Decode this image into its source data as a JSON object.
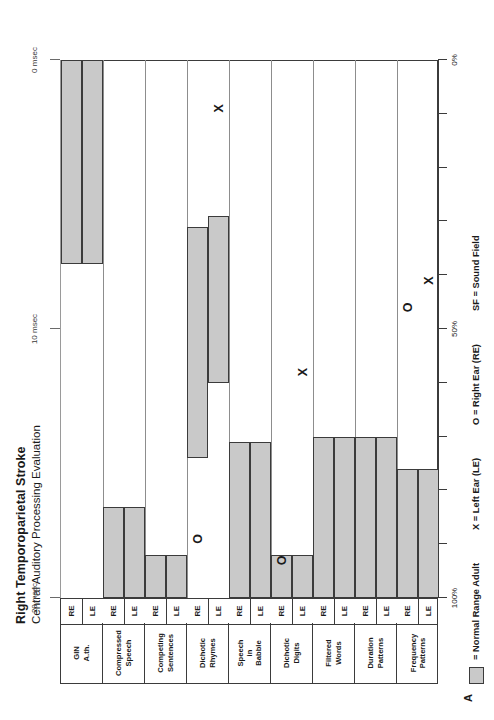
{
  "title": {
    "line1": "Right Temporoparietal Stroke",
    "line2": "Central Auditory Processing Evaluation"
  },
  "panel_label": "A",
  "ear_labels": {
    "left": "LE",
    "right": "RE"
  },
  "legend": {
    "swatch_label": "= Normal Range Adult",
    "x_label": "X = Left Ear (LE)",
    "o_label": "O = Right Ear (RE)",
    "sf_label": "SF = Sound Field",
    "x_glyph": "X",
    "o_glyph": "O"
  },
  "colors": {
    "normal_range_fill": "#c9c9c9",
    "line": "#3b3b3b",
    "background": "#ffffff"
  },
  "percent_axis": {
    "labels": [
      "100%",
      "50%",
      "0%"
    ],
    "label_values": [
      100,
      50,
      0
    ],
    "ticks": [
      100,
      90,
      80,
      70,
      60,
      50,
      40,
      30,
      20,
      10,
      0
    ]
  },
  "msec_axis": {
    "labels": [
      "20 msec",
      "10 msec",
      "0 msec"
    ],
    "label_values": [
      20,
      10,
      0
    ]
  },
  "chart_data": {
    "type": "bar",
    "xlabel": "",
    "ylabel": "Percent Correct",
    "xlim": [
      100,
      0
    ],
    "grid": false,
    "orientation": "horizontal",
    "legend_position": "bottom",
    "note": "Shaded bars = normal adult range for each test/ear. X = patient Left Ear score, O = patient Right Ear score. GIN A.th. uses the msec scale (20-0 msec) instead of percent.",
    "categories": [
      "Frequency Patterns",
      "Duration Patterns",
      "Filtered Words",
      "Dichotic Digits",
      "Speech in Babble",
      "Dichotic Rhymes",
      "Competing Sentences",
      "Compressed Speech",
      "GIN A.th."
    ],
    "rows": [
      {
        "category": "Frequency Patterns",
        "category_lines": [
          "Frequency",
          "Patterns"
        ],
        "scale": "percent",
        "normal_range": {
          "LE": [
            100,
            76
          ],
          "RE": [
            100,
            76
          ]
        },
        "patient": {
          "LE": 41,
          "RE": 46
        }
      },
      {
        "category": "Duration Patterns",
        "category_lines": [
          "Duration",
          "Patterns"
        ],
        "scale": "percent",
        "normal_range": {
          "LE": [
            100,
            70
          ],
          "RE": [
            100,
            70
          ]
        },
        "patient": {
          "LE": null,
          "RE": null
        }
      },
      {
        "category": "Filtered Words",
        "category_lines": [
          "Filtered",
          "Words"
        ],
        "scale": "percent",
        "normal_range": {
          "LE": [
            100,
            70
          ],
          "RE": [
            100,
            70
          ]
        },
        "patient": {
          "LE": null,
          "RE": null
        }
      },
      {
        "category": "Dichotic Digits",
        "category_lines": [
          "Dichotic",
          "Digits"
        ],
        "scale": "percent",
        "normal_range": {
          "LE": [
            100,
            92
          ],
          "RE": [
            100,
            92
          ]
        },
        "patient": {
          "LE": 58,
          "RE": 93
        }
      },
      {
        "category": "Speech in Babble",
        "category_lines": [
          "Speech",
          "in",
          "Babble"
        ],
        "scale": "percent",
        "normal_range": {
          "LE": [
            100,
            71
          ],
          "RE": [
            100,
            71
          ]
        },
        "patient": {
          "LE": null,
          "RE": null
        }
      },
      {
        "category": "Dichotic Rhymes",
        "category_lines": [
          "Dichotic",
          "Rhymes"
        ],
        "scale": "percent",
        "normal_range": {
          "LE": [
            60,
            29
          ],
          "RE": [
            74,
            31
          ]
        },
        "patient": {
          "LE": 9,
          "RE": 89
        }
      },
      {
        "category": "Competing Sentences",
        "category_lines": [
          "Competing",
          "Sentences"
        ],
        "scale": "percent",
        "normal_range": {
          "LE": [
            100,
            92
          ],
          "RE": [
            100,
            92
          ]
        },
        "patient": {
          "LE": null,
          "RE": null
        }
      },
      {
        "category": "Compressed Speech",
        "category_lines": [
          "Compressed",
          "Speech"
        ],
        "scale": "percent",
        "normal_range": {
          "LE": [
            100,
            83
          ],
          "RE": [
            100,
            83
          ]
        },
        "patient": {
          "LE": null,
          "RE": null
        }
      },
      {
        "category": "GIN A.th.",
        "category_lines": [
          "GIN",
          "A.th."
        ],
        "scale": "msec",
        "normal_range_msec": {
          "LE": [
            7.6,
            0.0
          ],
          "RE": [
            7.6,
            0.0
          ]
        },
        "patient": {
          "LE": null,
          "RE": null
        }
      }
    ]
  }
}
